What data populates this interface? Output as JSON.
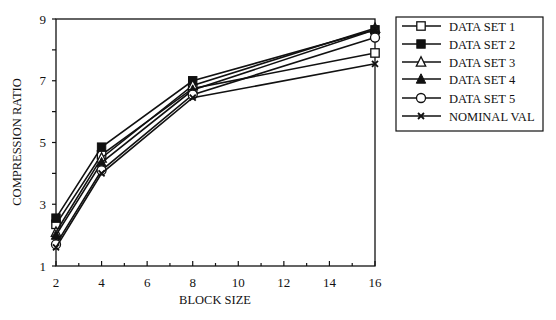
{
  "chart_data": {
    "type": "line",
    "title": "",
    "xlabel": "BLOCK SIZE",
    "ylabel": "COMPRESSION RATIO",
    "x": [
      2,
      4,
      8,
      16
    ],
    "xlim": [
      2,
      16
    ],
    "ylim": [
      1,
      9
    ],
    "xticks": [
      2,
      4,
      6,
      8,
      10,
      12,
      14,
      16
    ],
    "yticks": [
      1,
      3,
      5,
      7,
      9
    ],
    "grid": false,
    "legend_position": "right-outside-top",
    "series": [
      {
        "name": "DATA SET 1",
        "marker": "open-square",
        "values": [
          2.35,
          4.6,
          6.75,
          7.9
        ]
      },
      {
        "name": "DATA SET 2",
        "marker": "filled-square",
        "values": [
          2.55,
          4.85,
          7.0,
          8.65
        ]
      },
      {
        "name": "DATA SET 3",
        "marker": "open-triangle",
        "values": [
          2.1,
          4.5,
          6.85,
          8.7
        ]
      },
      {
        "name": "DATA SET 4",
        "marker": "filled-triangle",
        "values": [
          2.0,
          4.35,
          6.7,
          8.65
        ]
      },
      {
        "name": "DATA SET 5",
        "marker": "open-circle",
        "values": [
          1.7,
          4.1,
          6.55,
          8.4
        ]
      },
      {
        "name": "NOMINAL VAL",
        "marker": "x-cross",
        "values": [
          1.6,
          4.0,
          6.45,
          7.55
        ]
      }
    ]
  },
  "colors": {
    "ink": "#111111",
    "background": "#ffffff"
  }
}
